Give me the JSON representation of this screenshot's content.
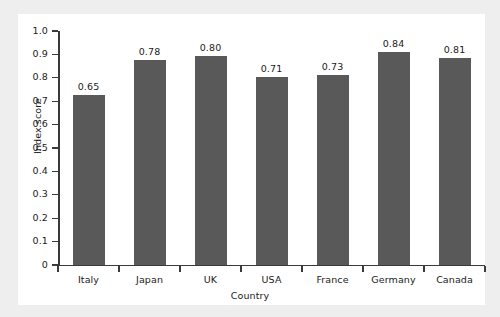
{
  "chart_data": {
    "type": "bar",
    "title": "",
    "xlabel": "Country",
    "ylabel": "Index score",
    "categories": [
      "Italy",
      "Japan",
      "UK",
      "USA",
      "France",
      "Germany",
      "Canada"
    ],
    "values": [
      0.65,
      0.78,
      0.8,
      0.71,
      0.73,
      0.84,
      0.81
    ],
    "data_labels": [
      "0.65",
      "0.78",
      "0.80",
      "0.71",
      "0.73",
      "0.84",
      "0.81"
    ],
    "drawn_bar_heights": [
      0.727,
      0.876,
      0.893,
      0.803,
      0.812,
      0.91,
      0.885
    ],
    "ylim": [
      0,
      1.0
    ],
    "ytick_labels": [
      "0",
      "0.1",
      "0.2",
      "0.3",
      "0.4",
      "0.5",
      "0.6",
      "0.7",
      "0.8",
      "0.9",
      "1.0"
    ],
    "ytick_values": [
      0,
      0.1,
      0.2,
      0.3,
      0.4,
      0.5,
      0.6,
      0.7,
      0.8,
      0.9,
      1.0
    ],
    "grid": false,
    "legend": false,
    "bar_color": "#595959",
    "panel_color": "#ffffff",
    "background_color": "#eeeeee",
    "axis_color": "#3a3a3a",
    "text_color": "#1a1a1a"
  }
}
